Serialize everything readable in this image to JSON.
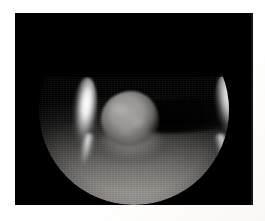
{
  "image": {
    "title": "Planetary crescent",
    "subject": "planet",
    "view": "crescent phase, illuminated southern limb",
    "background_color": "#000000",
    "frame_color": "#ffffff",
    "caption": ""
  },
  "frame": {
    "label": "white photographic mount",
    "left": 15,
    "top": 13,
    "width": 238,
    "height": 192
  },
  "features": [
    {
      "name": "left-limb-crescent",
      "label": "Bright limb crescent (left)",
      "brightness": "highlight",
      "color": "#ffffff"
    },
    {
      "name": "right-limb-crescent",
      "label": "Bright limb crescent (right)",
      "brightness": "highlight",
      "color": "#ffffff"
    },
    {
      "name": "grey-round-feature",
      "label": "Grey rounded feature (upper left)",
      "brightness": "mid-grey",
      "color": "#96948f"
    },
    {
      "name": "dark-equatorial-band",
      "label": "Dark band across mid-right",
      "brightness": "shadow",
      "color": "#000000"
    },
    {
      "name": "illuminated-bowl",
      "label": "Illuminated lower hemisphere with cloud banding",
      "brightness": "mid-to-light grey",
      "color": "#b2afab"
    },
    {
      "name": "night-side",
      "label": "Unlit upper hemisphere",
      "brightness": "black",
      "color": "#000000"
    }
  ],
  "colors": {
    "black": "#000000",
    "white": "#ffffff",
    "highlight": "#ffffff",
    "midgrey": "#96948f",
    "lightgrey": "#cdcac6",
    "shadow": "#121212"
  }
}
